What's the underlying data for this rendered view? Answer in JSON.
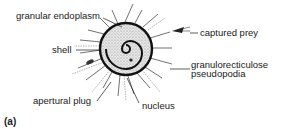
{
  "figure": {
    "panel_label": "(a)",
    "labels": {
      "granular_endoplasm": "granular endoplasm",
      "shell": "shell",
      "captured_prey": "captured prey",
      "granuloreticulose_line1": "granulorecticulose",
      "granuloreticulose_line2": "pseudopodia",
      "apertural_plug": "apertural plug",
      "nucleus": "nucleus"
    },
    "colors": {
      "ink": "#1a1a1a",
      "stipple": "#888888",
      "background": "#ffffff"
    }
  }
}
